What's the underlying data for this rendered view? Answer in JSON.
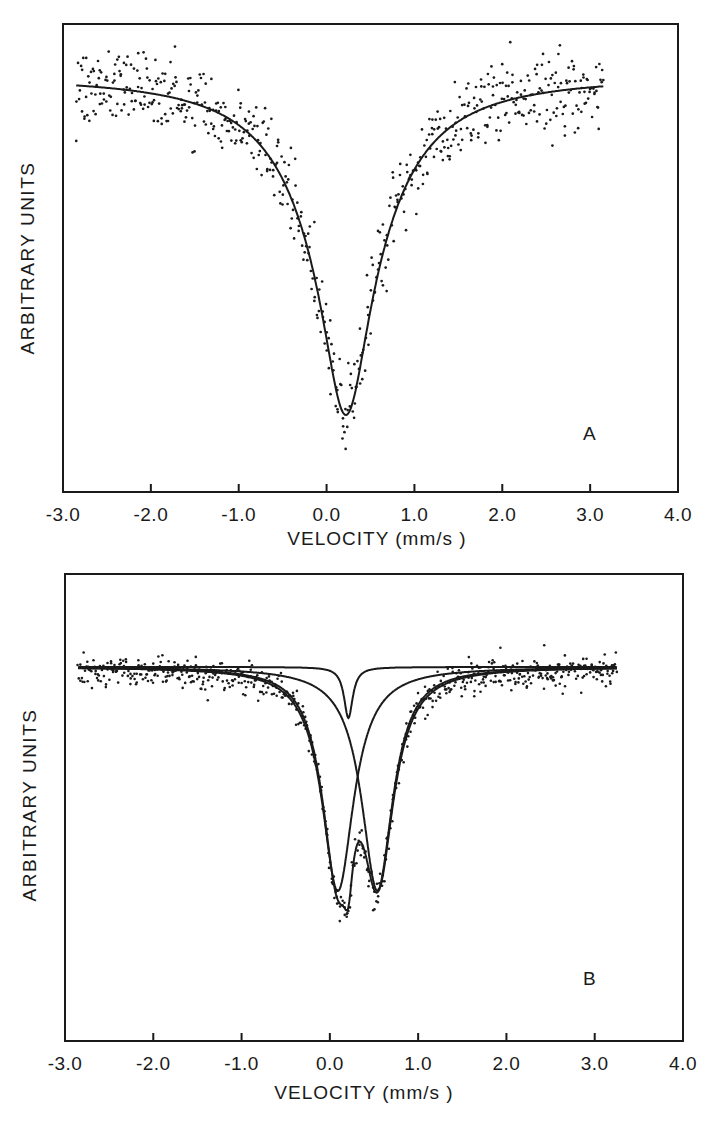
{
  "chart_data": [
    {
      "panel": "A",
      "type": "scatter",
      "title": "",
      "panel_label": "A",
      "xlabel": "VELOCITY (mm/s)",
      "ylabel": "ARBITRARY UNITS",
      "xlim": [
        -3.0,
        4.0
      ],
      "x_ticks": [
        "-3.0",
        "-2.0",
        "-1.0",
        "0.0",
        "1.0",
        "2.0",
        "3.0",
        "4.0"
      ],
      "y_ticks": [],
      "grid": false,
      "data_range_x": [
        -2.85,
        3.15
      ],
      "series": [
        {
          "name": "measured spectrum",
          "kind": "points",
          "noise": "high"
        },
        {
          "name": "single Lorentzian fit",
          "kind": "line",
          "center": 0.22,
          "fwhm": 0.75,
          "relative_depth": 0.85
        }
      ]
    },
    {
      "panel": "B",
      "type": "scatter",
      "title": "",
      "panel_label": "B",
      "xlabel": "VELOCITY (mm/s)",
      "ylabel": "ARBITRARY UNITS",
      "xlim": [
        -3.0,
        4.0
      ],
      "x_ticks": [
        "-3.0",
        "-2.0",
        "-1.0",
        "0.0",
        "1.0",
        "2.0",
        "3.0",
        "4.0"
      ],
      "y_ticks": [],
      "grid": false,
      "data_range_x": [
        -2.85,
        3.25
      ],
      "series": [
        {
          "name": "measured spectrum",
          "kind": "points",
          "noise": "low"
        },
        {
          "name": "component 1",
          "kind": "line",
          "center": 0.09,
          "fwhm": 0.42,
          "relative_depth": 0.62
        },
        {
          "name": "component 2",
          "kind": "line",
          "center": 0.54,
          "fwhm": 0.42,
          "relative_depth": 0.62
        },
        {
          "name": "component 3",
          "kind": "line",
          "center": 0.21,
          "fwhm": 0.12,
          "relative_depth": 0.15
        },
        {
          "name": "total fit",
          "kind": "line",
          "minima": [
            0.15,
            0.47
          ],
          "relative_depth": 0.88
        }
      ]
    }
  ],
  "panels": {
    "a": {
      "letter": "A",
      "xlabel": "VELOCITY (mm/s )",
      "ylabel": "ARBITRARY UNITS",
      "ticks": [
        "-3.0",
        "-2.0",
        "-1.0",
        "0.0",
        "1.0",
        "2.0",
        "3.0",
        "4.0"
      ]
    },
    "b": {
      "letter": "B",
      "xlabel": "VELOCITY (mm/s )",
      "ylabel": "ARBITRARY UNITS",
      "ticks": [
        "-3.0",
        "-2.0",
        "-1.0",
        "0.0",
        "1.0",
        "2.0",
        "3.0",
        "4.0"
      ]
    }
  },
  "colors": {
    "ink": "#1a1a1a",
    "background": "#ffffff"
  }
}
